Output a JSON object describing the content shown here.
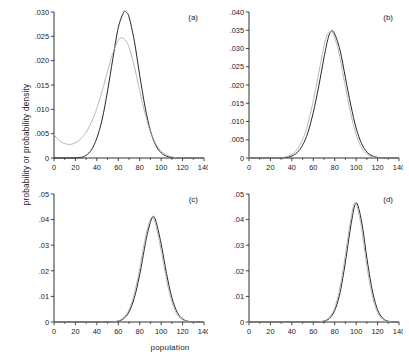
{
  "figure": {
    "ylabel": "probability or probability density",
    "xlabel": "population"
  },
  "chart_data": [
    {
      "type": "line",
      "panel_label": "(a)",
      "title": "",
      "xlabel": "population",
      "ylabel": "probability or probability density",
      "xlim": [
        0,
        140
      ],
      "ylim": [
        0,
        0.03
      ],
      "xticks": [
        0,
        20,
        40,
        60,
        80,
        100,
        120,
        140
      ],
      "xticklabels": [
        "0",
        "20",
        "40",
        "60",
        "80",
        "100",
        "120",
        "140"
      ],
      "yticks": [
        0,
        0.005,
        0.01,
        0.015,
        0.02,
        0.025,
        0.03
      ],
      "yticklabels": [
        "0",
        ".005",
        ".010",
        ".015",
        ".020",
        ".025",
        ".030"
      ],
      "grid": false,
      "legend": "none",
      "series": [
        {
          "name": "solid",
          "style": "solid",
          "color": "#262626",
          "x": [
            0,
            5,
            10,
            15,
            20,
            25,
            30,
            35,
            40,
            45,
            50,
            55,
            60,
            65,
            67,
            70,
            75,
            80,
            85,
            90,
            95,
            100,
            105,
            110,
            115,
            120,
            130,
            140
          ],
          "y": [
            0,
            0,
            0,
            0,
            2e-05,
            0.00012,
            0.00055,
            0.0017,
            0.0041,
            0.008,
            0.0138,
            0.0205,
            0.0268,
            0.0299,
            0.03,
            0.029,
            0.024,
            0.017,
            0.0105,
            0.0056,
            0.0026,
            0.00105,
            0.00038,
            0.00012,
            4e-05,
            1e-05,
            0,
            0
          ]
        },
        {
          "name": "dotted",
          "style": "dotted",
          "color": "#a8a8a8",
          "x": [
            0,
            3,
            6,
            9,
            12,
            15,
            18,
            22,
            26,
            30,
            35,
            40,
            45,
            50,
            55,
            60,
            63,
            66,
            70,
            75,
            80,
            85,
            90,
            95,
            100,
            105,
            110,
            115,
            120,
            130,
            140
          ],
          "y": [
            0.0048,
            0.004,
            0.0034,
            0.00305,
            0.00285,
            0.0028,
            0.00295,
            0.0034,
            0.0042,
            0.0053,
            0.0074,
            0.0102,
            0.0138,
            0.0178,
            0.0216,
            0.0242,
            0.0247,
            0.0243,
            0.0228,
            0.0188,
            0.0138,
            0.0091,
            0.0054,
            0.0029,
            0.0014,
            0.0006,
            0.00022,
            8e-05,
            2e-05,
            0,
            0
          ]
        }
      ]
    },
    {
      "type": "line",
      "panel_label": "(b)",
      "title": "",
      "xlabel": "population",
      "ylabel": "probability or probability density",
      "xlim": [
        0,
        140
      ],
      "ylim": [
        0,
        0.04
      ],
      "xticks": [
        0,
        20,
        40,
        60,
        80,
        100,
        120,
        140
      ],
      "xticklabels": [
        "0",
        "20",
        "40",
        "60",
        "80",
        "100",
        "120",
        "140"
      ],
      "yticks": [
        0,
        0.005,
        0.01,
        0.015,
        0.02,
        0.025,
        0.03,
        0.035,
        0.04
      ],
      "yticklabels": [
        "0",
        ".005",
        ".010",
        ".015",
        ".020",
        ".025",
        ".030",
        ".035",
        ".040"
      ],
      "grid": false,
      "legend": "none",
      "series": [
        {
          "name": "solid",
          "style": "solid",
          "color": "#262626",
          "x": [
            0,
            20,
            30,
            35,
            40,
            45,
            50,
            55,
            60,
            65,
            70,
            74,
            77,
            80,
            85,
            90,
            95,
            100,
            105,
            110,
            115,
            120,
            130,
            140
          ],
          "y": [
            0,
            0,
            5e-05,
            0.00018,
            0.00055,
            0.0015,
            0.0035,
            0.007,
            0.0125,
            0.0195,
            0.0275,
            0.033,
            0.0348,
            0.034,
            0.0295,
            0.022,
            0.0145,
            0.0082,
            0.004,
            0.00165,
            0.0006,
            0.00018,
            1e-05,
            0
          ]
        },
        {
          "name": "dotted",
          "style": "dotted",
          "color": "#a8a8a8",
          "x": [
            0,
            20,
            28,
            33,
            38,
            43,
            48,
            53,
            58,
            63,
            68,
            72,
            76,
            79,
            84,
            89,
            94,
            99,
            104,
            109,
            114,
            119,
            130,
            140
          ],
          "y": [
            0,
            0,
            6e-05,
            0.00022,
            0.00065,
            0.0017,
            0.0038,
            0.0074,
            0.013,
            0.02,
            0.0278,
            0.033,
            0.0346,
            0.0338,
            0.0288,
            0.021,
            0.0135,
            0.0074,
            0.0034,
            0.0013,
            0.00045,
            0.00012,
            0,
            0
          ]
        }
      ]
    },
    {
      "type": "line",
      "panel_label": "(c)",
      "title": "",
      "xlabel": "population",
      "ylabel": "probability or probability density",
      "xlim": [
        0,
        140
      ],
      "ylim": [
        0,
        0.05
      ],
      "xticks": [
        0,
        20,
        40,
        60,
        80,
        100,
        120,
        140
      ],
      "xticklabels": [
        "0",
        "20",
        "40",
        "60",
        "80",
        "100",
        "120",
        "140"
      ],
      "yticks": [
        0,
        0.01,
        0.02,
        0.03,
        0.04,
        0.05
      ],
      "yticklabels": [
        "0",
        ".01",
        ".02",
        ".03",
        ".04",
        ".05"
      ],
      "grid": false,
      "legend": "none",
      "series": [
        {
          "name": "solid",
          "style": "solid",
          "color": "#262626",
          "x": [
            0,
            40,
            55,
            60,
            65,
            70,
            75,
            80,
            85,
            88,
            92,
            95,
            100,
            105,
            110,
            115,
            120,
            125,
            130,
            140
          ],
          "y": [
            0,
            0,
            0.0001,
            0.00035,
            0.0013,
            0.0039,
            0.0095,
            0.0185,
            0.03,
            0.036,
            0.041,
            0.0395,
            0.0305,
            0.019,
            0.0095,
            0.0038,
            0.0012,
            0.0003,
            6e-05,
            0
          ]
        },
        {
          "name": "dotted",
          "style": "dotted",
          "color": "#a8a8a8",
          "x": [
            0,
            40,
            54,
            59,
            64,
            69,
            74,
            79,
            84,
            87,
            91,
            94,
            99,
            104,
            109,
            114,
            119,
            124,
            130,
            140
          ],
          "y": [
            0,
            0,
            0.0001,
            0.00038,
            0.00135,
            0.004,
            0.0096,
            0.0188,
            0.0302,
            0.0362,
            0.0409,
            0.0393,
            0.0302,
            0.0188,
            0.0093,
            0.00365,
            0.00115,
            0.00028,
            5e-05,
            0
          ]
        }
      ]
    },
    {
      "type": "line",
      "panel_label": "(d)",
      "title": "",
      "xlabel": "population",
      "ylabel": "probability or probability density",
      "xlim": [
        0,
        140
      ],
      "ylim": [
        0,
        0.05
      ],
      "xticks": [
        0,
        20,
        40,
        60,
        80,
        100,
        120,
        140
      ],
      "xticklabels": [
        "0",
        "20",
        "40",
        "60",
        "80",
        "100",
        "120",
        "140"
      ],
      "yticks": [
        0,
        0.01,
        0.02,
        0.03,
        0.04,
        0.05
      ],
      "yticklabels": [
        "0",
        ".01",
        ".02",
        ".03",
        ".04",
        ".05"
      ],
      "grid": false,
      "legend": "none",
      "series": [
        {
          "name": "solid",
          "style": "solid",
          "color": "#262626",
          "x": [
            0,
            50,
            65,
            70,
            75,
            80,
            85,
            90,
            95,
            99,
            102,
            106,
            110,
            115,
            120,
            125,
            130,
            135,
            140
          ],
          "y": [
            0,
            0,
            8e-05,
            0.00035,
            0.0014,
            0.0045,
            0.0115,
            0.0235,
            0.0375,
            0.046,
            0.045,
            0.037,
            0.025,
            0.0125,
            0.0048,
            0.0014,
            0.0003,
            5e-05,
            0
          ]
        },
        {
          "name": "dotted",
          "style": "dotted",
          "color": "#a8a8a8",
          "x": [
            0,
            50,
            64,
            69,
            74,
            79,
            84,
            89,
            94,
            98,
            101,
            105,
            109,
            114,
            119,
            124,
            129,
            134,
            140
          ],
          "y": [
            0,
            0,
            8e-05,
            0.00036,
            0.00145,
            0.0046,
            0.0116,
            0.0236,
            0.0376,
            0.0459,
            0.0449,
            0.0369,
            0.0248,
            0.0123,
            0.0047,
            0.00135,
            0.00028,
            5e-05,
            0
          ]
        }
      ]
    }
  ]
}
